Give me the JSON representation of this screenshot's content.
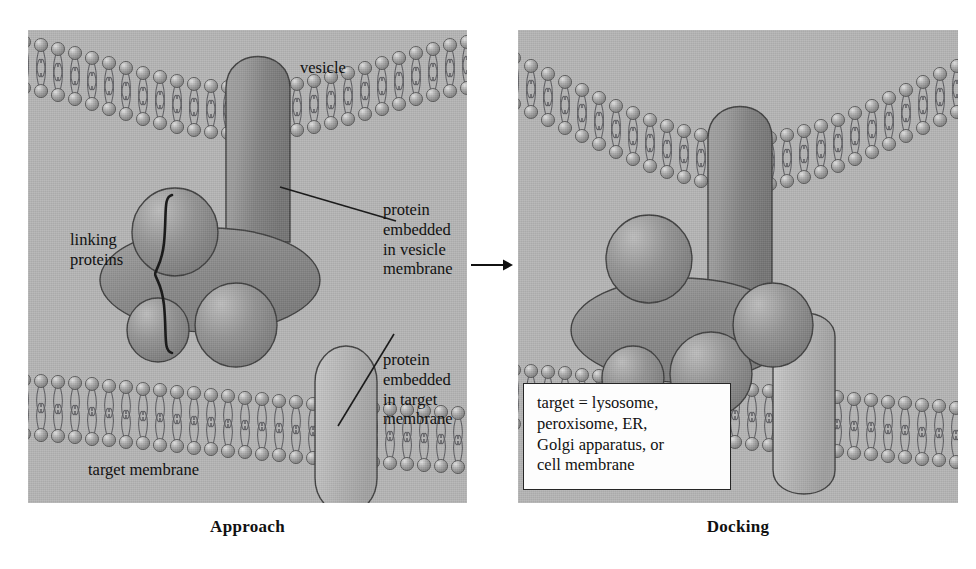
{
  "figure": {
    "title_left": "Approach",
    "title_right": "Docking"
  },
  "panels": [
    {
      "id": "approach",
      "caption": "Approach",
      "labels": {
        "vesicle": "vesicle",
        "linking_proteins": "linking\nproteins",
        "linking_proteins_line1": "linking",
        "linking_proteins_line2": "proteins",
        "vesicle_protein_line1": "protein",
        "vesicle_protein_line2": "embedded",
        "vesicle_protein_line3": "in vesicle",
        "vesicle_protein_line4": "membrane",
        "target_protein_line1": "protein",
        "target_protein_line2": "embedded",
        "target_protein_line3": "in target",
        "target_protein_line4": "membrane",
        "target_membrane": "target membrane"
      }
    },
    {
      "id": "docking",
      "caption": "Docking",
      "labels": {
        "vesicle": "vesicle"
      },
      "infobox": {
        "line1": "target = lysosome,",
        "line2": "peroxisome, ER,",
        "line3": "Golgi apparatus, or",
        "line4": "cell membrane"
      }
    }
  ],
  "colors": {
    "panel_background": "#b5b5b5",
    "lipid_head": "#9a9a9a",
    "lipid_head_highlight": "#d6d6d6",
    "lipid_tail_stroke": "#55555a",
    "vesicle_protein": "#8d8d8d",
    "linking_protein": "#8a8a8a",
    "target_protein": "#aeaeae",
    "outline": "#3a3a3a",
    "text": "#111111",
    "infobox_background": "#fdfdfd",
    "infobox_border": "#262626"
  },
  "icons": {
    "transition_arrow": "arrow-right-icon",
    "curly_brace": "curly-brace-icon"
  }
}
